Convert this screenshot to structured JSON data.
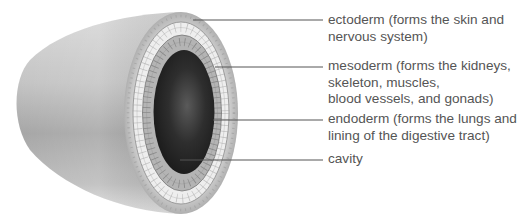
{
  "figure": {
    "colors": {
      "body_light": "#d6d6d6",
      "body_dark": "#9a9a9a",
      "ectoderm": "#bdbdbd",
      "mesoderm_cells": "#ececec",
      "endoderm_cells": "#a8a8a8",
      "cavity": "#2a2a2a",
      "leader_line": "#555555",
      "label_text": "#555555"
    }
  },
  "labels": [
    {
      "id": "ectoderm",
      "lines": [
        "ectoderm (forms the skin and",
        "nervous system)"
      ],
      "pointer": {
        "x1": 193,
        "y1": 20,
        "x2": 323,
        "y2": 20
      }
    },
    {
      "id": "mesoderm",
      "lines": [
        "mesoderm (forms the kidneys,",
        "skeleton, muscles,",
        "blood vessels, and gonads)"
      ],
      "pointer": {
        "x1": 215,
        "y1": 67,
        "x2": 323,
        "y2": 67
      }
    },
    {
      "id": "endoderm",
      "lines": [
        "endoderm (forms the lungs and",
        "lining of the digestive tract)"
      ],
      "pointer": {
        "x1": 213,
        "y1": 120,
        "x2": 323,
        "y2": 120
      }
    },
    {
      "id": "cavity",
      "lines": [
        "cavity"
      ],
      "pointer": {
        "x1": 180,
        "y1": 160,
        "x2": 323,
        "y2": 160
      }
    }
  ]
}
